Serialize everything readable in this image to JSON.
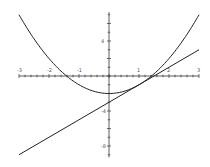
{
  "chart_data": {
    "type": "line",
    "title": "",
    "xlabel": "",
    "ylabel": "",
    "xlim": [
      -3,
      3
    ],
    "ylim": [
      -9.3,
      7.3
    ],
    "grid": false,
    "x_ticks": [
      "-3",
      "-2",
      "-1",
      "1",
      "2",
      "3"
    ],
    "y_ticks": [
      "4",
      "-4",
      "-8"
    ],
    "series": [
      {
        "name": "parabola y = x^2 - 2",
        "function": "x^2 - 2",
        "x": [
          -3,
          -2,
          -1,
          0,
          1,
          2,
          3
        ],
        "values": [
          7,
          2,
          -1,
          -2,
          -1,
          2,
          7
        ]
      },
      {
        "name": "tangent line y = 2x - 3",
        "function": "2x - 3",
        "x": [
          -3,
          0,
          3
        ],
        "values": [
          -9,
          -3,
          3
        ]
      }
    ],
    "colors": {
      "curve": "#222222",
      "axis": "#333333",
      "background": "#ffffff"
    }
  }
}
